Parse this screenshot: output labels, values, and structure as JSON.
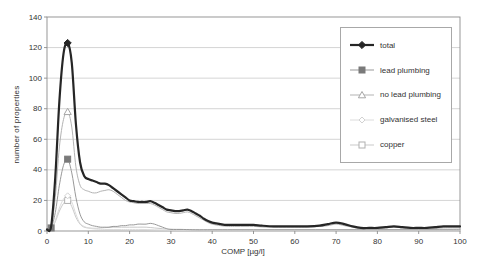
{
  "chart_data": {
    "type": "line",
    "title": "",
    "xlabel": "COMP [µg/l]",
    "ylabel": "number of properties",
    "xlim": [
      0,
      100
    ],
    "ylim": [
      0,
      140
    ],
    "x_ticks": [
      0,
      10,
      20,
      30,
      40,
      50,
      60,
      70,
      80,
      90,
      100
    ],
    "y_ticks": [
      0,
      20,
      40,
      60,
      80,
      100,
      120,
      140
    ],
    "grid": "horizontal",
    "legend_position": "top-right-overlay",
    "colors": {
      "background": "#ffffff",
      "gridline": "#c9c9c9",
      "axis": "#8c8c8c",
      "text": "#333333"
    },
    "series": [
      {
        "name": "total",
        "color": "#262626",
        "line_width": 2.2,
        "marker": "filled-diamond",
        "marker_color": "#262626",
        "marker_points": [
          [
            5,
            123
          ]
        ],
        "points": [
          [
            0,
            1
          ],
          [
            1,
            3
          ],
          [
            2,
            35
          ],
          [
            3,
            85
          ],
          [
            4,
            116
          ],
          [
            5,
            123
          ],
          [
            6,
            110
          ],
          [
            7,
            70
          ],
          [
            8,
            45
          ],
          [
            9,
            36
          ],
          [
            10,
            34
          ],
          [
            11,
            33
          ],
          [
            12,
            32
          ],
          [
            13,
            31
          ],
          [
            14,
            31
          ],
          [
            15,
            30
          ],
          [
            16,
            28
          ],
          [
            17,
            26
          ],
          [
            18,
            24
          ],
          [
            19,
            22
          ],
          [
            20,
            20
          ],
          [
            21,
            19.5
          ],
          [
            22,
            19
          ],
          [
            23,
            19
          ],
          [
            24,
            19
          ],
          [
            25,
            19.5
          ],
          [
            26,
            18.5
          ],
          [
            27,
            17
          ],
          [
            28,
            15.5
          ],
          [
            29,
            14
          ],
          [
            30,
            13.5
          ],
          [
            31,
            13
          ],
          [
            32,
            13
          ],
          [
            33,
            13.5
          ],
          [
            34,
            14
          ],
          [
            35,
            13
          ],
          [
            36,
            11.5
          ],
          [
            37,
            10
          ],
          [
            38,
            8
          ],
          [
            39,
            6.5
          ],
          [
            40,
            5.5
          ],
          [
            41,
            5
          ],
          [
            42,
            4.5
          ],
          [
            43,
            4
          ],
          [
            45,
            4
          ],
          [
            47,
            4
          ],
          [
            50,
            4
          ],
          [
            52,
            3.5
          ],
          [
            55,
            3
          ],
          [
            58,
            3
          ],
          [
            60,
            3
          ],
          [
            63,
            3
          ],
          [
            66,
            3.5
          ],
          [
            68,
            4.5
          ],
          [
            70,
            5.5
          ],
          [
            72,
            4.5
          ],
          [
            74,
            3
          ],
          [
            76,
            2
          ],
          [
            78,
            2
          ],
          [
            80,
            2
          ],
          [
            82,
            2.5
          ],
          [
            84,
            3
          ],
          [
            86,
            2.5
          ],
          [
            88,
            2
          ],
          [
            90,
            2
          ],
          [
            92,
            2
          ],
          [
            94,
            2.5
          ],
          [
            96,
            3
          ],
          [
            98,
            3
          ],
          [
            100,
            3
          ]
        ]
      },
      {
        "name": "lead plumbing",
        "color": "#999999",
        "line_width": 1,
        "marker": "filled-square",
        "marker_color": "#7a7a7a",
        "marker_points": [
          [
            1,
            2
          ],
          [
            5,
            47
          ]
        ],
        "points": [
          [
            0,
            0.5
          ],
          [
            1,
            2
          ],
          [
            2,
            12
          ],
          [
            3,
            30
          ],
          [
            4,
            43
          ],
          [
            5,
            47
          ],
          [
            6,
            38
          ],
          [
            7,
            22
          ],
          [
            8,
            11
          ],
          [
            9,
            6
          ],
          [
            10,
            4.5
          ],
          [
            11,
            3.5
          ],
          [
            12,
            3
          ],
          [
            13,
            2.5
          ],
          [
            14,
            2.5
          ],
          [
            15,
            2.5
          ],
          [
            16,
            3
          ],
          [
            17,
            3
          ],
          [
            18,
            3.5
          ],
          [
            19,
            3.5
          ],
          [
            20,
            4
          ],
          [
            21,
            4
          ],
          [
            22,
            4.5
          ],
          [
            23,
            4.5
          ],
          [
            24,
            4.5
          ],
          [
            25,
            5
          ],
          [
            26,
            4.5
          ],
          [
            27,
            3.5
          ],
          [
            28,
            2.5
          ],
          [
            29,
            1.5
          ],
          [
            30,
            1
          ],
          [
            33,
            1
          ],
          [
            36,
            0.8
          ],
          [
            40,
            0.8
          ],
          [
            45,
            0.8
          ],
          [
            50,
            0.8
          ],
          [
            55,
            0.8
          ],
          [
            60,
            0.8
          ],
          [
            65,
            0.8
          ],
          [
            70,
            0.8
          ],
          [
            75,
            0.8
          ],
          [
            80,
            0.8
          ],
          [
            85,
            0.8
          ],
          [
            90,
            0.8
          ],
          [
            95,
            0.8
          ],
          [
            100,
            0.8
          ]
        ]
      },
      {
        "name": "no lead plumbing",
        "color": "#b3b3b3",
        "line_width": 1,
        "marker": "open-triangle",
        "marker_color": "#a6a6a6",
        "marker_points": [
          [
            5,
            78
          ]
        ],
        "points": [
          [
            0,
            1
          ],
          [
            1,
            2
          ],
          [
            2,
            22
          ],
          [
            3,
            55
          ],
          [
            4,
            73
          ],
          [
            5,
            78
          ],
          [
            6,
            68
          ],
          [
            7,
            42
          ],
          [
            8,
            30
          ],
          [
            9,
            27
          ],
          [
            10,
            26
          ],
          [
            11,
            25
          ],
          [
            12,
            25
          ],
          [
            13,
            26
          ],
          [
            14,
            26.5
          ],
          [
            15,
            27
          ],
          [
            16,
            26
          ],
          [
            17,
            24
          ],
          [
            18,
            22
          ],
          [
            19,
            20
          ],
          [
            20,
            19
          ],
          [
            21,
            18.5
          ],
          [
            22,
            18
          ],
          [
            23,
            18
          ],
          [
            24,
            18
          ],
          [
            25,
            18
          ],
          [
            26,
            17
          ],
          [
            27,
            15.5
          ],
          [
            28,
            14
          ],
          [
            29,
            12.5
          ],
          [
            30,
            12
          ],
          [
            31,
            11.5
          ],
          [
            32,
            11.5
          ],
          [
            33,
            12
          ],
          [
            34,
            12.5
          ],
          [
            35,
            11.5
          ],
          [
            36,
            10
          ],
          [
            37,
            8.5
          ],
          [
            38,
            7
          ],
          [
            39,
            5.5
          ],
          [
            40,
            4.5
          ],
          [
            42,
            3.5
          ],
          [
            44,
            3
          ],
          [
            46,
            3
          ],
          [
            50,
            3
          ],
          [
            53,
            2.5
          ],
          [
            56,
            2.5
          ],
          [
            60,
            2.5
          ],
          [
            63,
            2.5
          ],
          [
            66,
            3
          ],
          [
            68,
            3.5
          ],
          [
            70,
            4.5
          ],
          [
            72,
            3.5
          ],
          [
            74,
            2.5
          ],
          [
            76,
            1.5
          ],
          [
            80,
            1.5
          ],
          [
            82,
            2
          ],
          [
            84,
            2.5
          ],
          [
            86,
            2
          ],
          [
            88,
            1.5
          ],
          [
            90,
            1.5
          ],
          [
            93,
            1.5
          ],
          [
            96,
            2
          ],
          [
            100,
            2
          ]
        ]
      },
      {
        "name": "galvanised steel",
        "color": "#dcdcdc",
        "line_width": 1,
        "marker": "open-diamond",
        "marker_color": "#d2d2d2",
        "marker_points": [
          [
            5,
            23
          ]
        ],
        "points": [
          [
            0,
            0.5
          ],
          [
            1,
            1
          ],
          [
            2,
            7
          ],
          [
            3,
            15
          ],
          [
            4,
            21
          ],
          [
            5,
            23
          ],
          [
            6,
            19
          ],
          [
            7,
            11
          ],
          [
            8,
            5
          ],
          [
            9,
            3
          ],
          [
            10,
            2
          ],
          [
            11,
            1.5
          ],
          [
            12,
            1.2
          ],
          [
            14,
            1
          ],
          [
            16,
            1
          ],
          [
            18,
            1
          ],
          [
            20,
            1
          ],
          [
            23,
            1
          ],
          [
            26,
            0.8
          ],
          [
            30,
            0.6
          ],
          [
            35,
            0.6
          ],
          [
            40,
            0.6
          ],
          [
            50,
            0.6
          ],
          [
            60,
            0.6
          ],
          [
            70,
            0.6
          ],
          [
            80,
            0.6
          ],
          [
            90,
            0.6
          ],
          [
            100,
            0.6
          ]
        ]
      },
      {
        "name": "copper",
        "color": "#c9c9c9",
        "line_width": 1,
        "marker": "open-square",
        "marker_color": "#b0b0b0",
        "marker_points": [
          [
            5,
            20
          ]
        ],
        "points": [
          [
            0,
            0.5
          ],
          [
            1,
            1
          ],
          [
            2,
            6
          ],
          [
            3,
            13
          ],
          [
            4,
            18
          ],
          [
            5,
            20
          ],
          [
            6,
            16
          ],
          [
            7,
            9
          ],
          [
            8,
            4.5
          ],
          [
            9,
            2.5
          ],
          [
            10,
            2
          ],
          [
            11,
            1.8
          ],
          [
            12,
            1.8
          ],
          [
            14,
            2.2
          ],
          [
            16,
            2.5
          ],
          [
            18,
            2.5
          ],
          [
            20,
            2.5
          ],
          [
            22,
            2.5
          ],
          [
            24,
            2.5
          ],
          [
            26,
            2
          ],
          [
            28,
            1.5
          ],
          [
            30,
            1.2
          ],
          [
            33,
            1
          ],
          [
            36,
            0.8
          ],
          [
            40,
            0.8
          ],
          [
            45,
            0.8
          ],
          [
            50,
            0.8
          ],
          [
            60,
            0.8
          ],
          [
            70,
            0.8
          ],
          [
            80,
            0.8
          ],
          [
            90,
            0.8
          ],
          [
            100,
            0.8
          ]
        ]
      }
    ]
  }
}
